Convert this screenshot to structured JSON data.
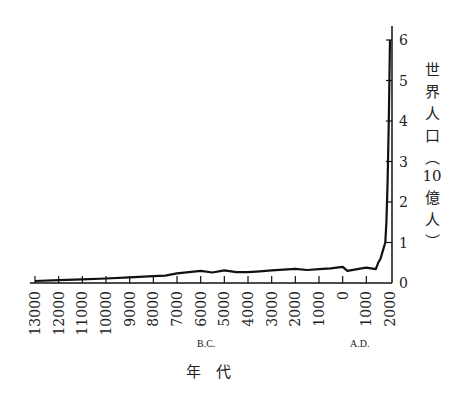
{
  "chart_data": {
    "type": "line",
    "title": "",
    "xlabel": "年　代",
    "ylabel": "世界人口（10億人）",
    "ylim": [
      0,
      6
    ],
    "yticks": [
      0,
      1,
      2,
      3,
      4,
      5,
      6
    ],
    "xticks": [
      "13000",
      "12000",
      "11000",
      "10000",
      "9000",
      "8000",
      "7000",
      "6000",
      "5000",
      "4000",
      "3000",
      "2000",
      "1000",
      "0",
      "1000",
      "2000"
    ],
    "era_labels": {
      "bc": "B.C.",
      "ad": "A.D."
    },
    "grid": false,
    "legend": "none",
    "series": [
      {
        "name": "世界人口",
        "x": [
          -13000,
          -12000,
          -11000,
          -10000,
          -9000,
          -8000,
          -7500,
          -7000,
          -6500,
          -6000,
          -5500,
          -5000,
          -4500,
          -4000,
          -3500,
          -3000,
          -2500,
          -2000,
          -1500,
          -1000,
          -500,
          0,
          200,
          500,
          800,
          1000,
          1200,
          1400,
          1500,
          1600,
          1700,
          1800,
          1850,
          1900,
          1950,
          2000
        ],
        "values": [
          0.05,
          0.07,
          0.09,
          0.11,
          0.14,
          0.17,
          0.18,
          0.24,
          0.27,
          0.3,
          0.26,
          0.31,
          0.27,
          0.27,
          0.29,
          0.31,
          0.33,
          0.35,
          0.32,
          0.34,
          0.36,
          0.4,
          0.3,
          0.33,
          0.36,
          0.38,
          0.36,
          0.34,
          0.5,
          0.6,
          0.8,
          1.0,
          1.5,
          2.5,
          4.0,
          6.0
        ]
      }
    ]
  }
}
